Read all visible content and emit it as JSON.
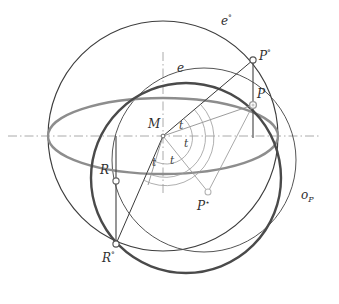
{
  "figure": {
    "background_color": "#ffffff",
    "width": 339,
    "height": 304
  },
  "colors": {
    "outline_sphere": "#3d3d3d",
    "ellipse_equator": "#8d8d8d",
    "circle_oP_dark": "#4a4a4a",
    "circle_thin": "#555555",
    "axis_dashdot": "#9a9a9a",
    "ray_light": "#8a8a8a",
    "ray_dark": "#3a3a3a",
    "marker_fill": "#ffffff",
    "marker_stroke": "#6a6a6a",
    "label_text": "#2f2f2f"
  },
  "labels": {
    "e_circle": {
      "base": "e",
      "sup": "°"
    },
    "e_ellipse": {
      "base": "e",
      "sup": ""
    },
    "o_circle": {
      "base": "o",
      "sub": "P"
    },
    "P_sphere": {
      "base": "P",
      "sup": "°"
    },
    "P_point": {
      "base": "P",
      "sup": ""
    },
    "P_star": {
      "base": "P",
      "sup": "⋆"
    },
    "R_point": {
      "base": "R",
      "sup": ""
    },
    "R_sphere": {
      "base": "R",
      "sup": "°"
    },
    "M_center": {
      "base": "M",
      "sup": ""
    },
    "angle_t": "t"
  },
  "angle_labels": [
    {
      "id": "t-upper-right",
      "text": "t",
      "x": 181,
      "y": 126
    },
    {
      "id": "t-mid-right",
      "text": "t",
      "x": 185,
      "y": 143
    },
    {
      "id": "t-lower-right",
      "text": "t",
      "x": 172,
      "y": 160
    },
    {
      "id": "t-lower-left",
      "text": "t",
      "x": 155,
      "y": 162
    }
  ],
  "points": [
    {
      "id": "M",
      "label": "M",
      "x": 163,
      "y": 136,
      "marker": "small-dot"
    },
    {
      "id": "P-sphere",
      "label": "P°",
      "x": 253,
      "y": 60,
      "marker": "open-circle"
    },
    {
      "id": "P",
      "label": "P",
      "x": 253,
      "y": 105,
      "marker": "ring-circle"
    },
    {
      "id": "P-star",
      "label": "P⋆",
      "x": 208,
      "y": 192,
      "marker": "light-open-circle"
    },
    {
      "id": "R",
      "label": "R",
      "x": 116,
      "y": 181,
      "marker": "open-circle"
    },
    {
      "id": "R-sphere",
      "label": "R°",
      "x": 116,
      "y": 244,
      "marker": "open-circle"
    }
  ],
  "geometry": {
    "sphere_outline": {
      "cx": 163,
      "cy": 136,
      "r": 115,
      "stroke_width": 1.1
    },
    "equator_ellipse": {
      "cx": 163,
      "cy": 136,
      "rx": 115,
      "ry": 38,
      "stroke_width": 2.2
    },
    "oP_circle_dark": {
      "cx": 186,
      "cy": 178,
      "r": 95,
      "stroke_width": 2.4
    },
    "oP_circle_thin": {
      "cx": 204,
      "cy": 160,
      "r": 92,
      "stroke_width": 1.1
    },
    "horizontal_axis": {
      "x1": 8,
      "y1": 136,
      "x2": 320,
      "y2": 136
    },
    "vertical_axis": {
      "x1": 163,
      "y1": 54,
      "x2": 163,
      "y2": 195
    }
  }
}
